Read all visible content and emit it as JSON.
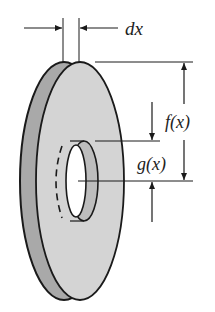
{
  "diagram": {
    "labels": {
      "thickness": "dx",
      "outer_radius": "f(x)",
      "inner_radius": "g(x)"
    },
    "colors": {
      "face_fill": "#d4d4d4",
      "rim_fill": "#a9a9a9",
      "stroke": "#1a1a1a",
      "background": "#ffffff"
    }
  }
}
